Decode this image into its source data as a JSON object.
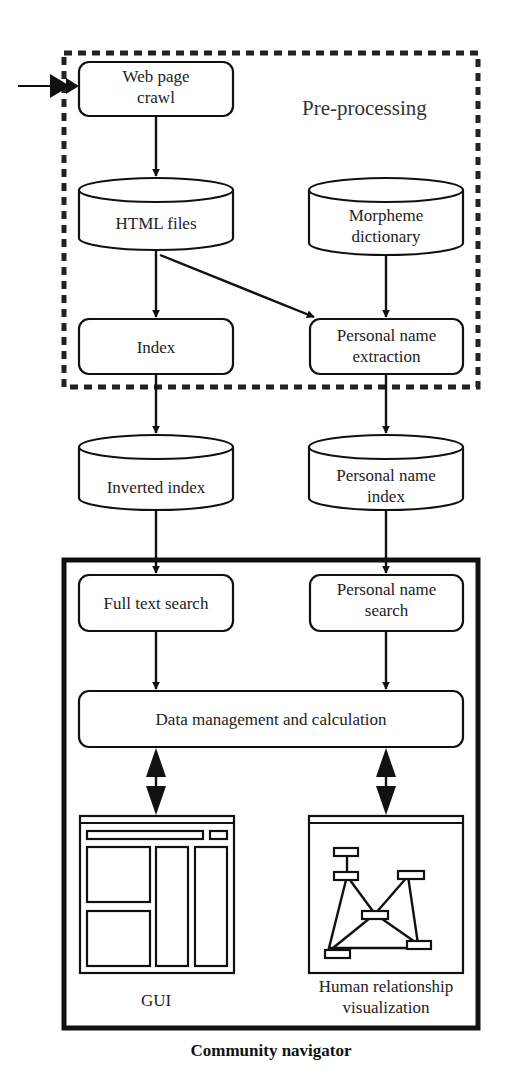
{
  "diagram": {
    "regions": {
      "preprocessing": {
        "title": "Pre-processing",
        "border": "dashed"
      },
      "community_navigator": {
        "title": "Community navigator",
        "border": "solid-thick"
      }
    },
    "nodes": {
      "web_crawl": {
        "line1": "Web page",
        "line2": "crawl",
        "shape": "rounded-rect"
      },
      "html_files": {
        "line1": "HTML files",
        "shape": "cylinder"
      },
      "morpheme_dict": {
        "line1": "Morpheme",
        "line2": "dictionary",
        "shape": "cylinder"
      },
      "index": {
        "line1": "Index",
        "shape": "rounded-rect"
      },
      "name_extraction": {
        "line1": "Personal name",
        "line2": "extraction",
        "shape": "rounded-rect"
      },
      "inverted_index": {
        "line1": "Inverted index",
        "shape": "cylinder"
      },
      "name_index": {
        "line1": "Personal name",
        "line2": "index",
        "shape": "cylinder"
      },
      "full_text_search": {
        "line1": "Full text search",
        "shape": "rounded-rect"
      },
      "name_search": {
        "line1": "Personal name",
        "line2": "search",
        "shape": "rounded-rect"
      },
      "data_mgmt": {
        "line1": "Data management and calculation",
        "shape": "rounded-rect"
      },
      "gui": {
        "line1": "GUI",
        "shape": "window-icon"
      },
      "visualization": {
        "line1": "Human relationship",
        "line2": "visualization",
        "shape": "graph-window-icon"
      }
    },
    "edges": [
      {
        "from": "external",
        "to": "web_crawl",
        "type": "arrow"
      },
      {
        "from": "web_crawl",
        "to": "html_files",
        "type": "arrow"
      },
      {
        "from": "html_files",
        "to": "index",
        "type": "arrow"
      },
      {
        "from": "html_files",
        "to": "name_extraction",
        "type": "arrow"
      },
      {
        "from": "morpheme_dict",
        "to": "name_extraction",
        "type": "arrow"
      },
      {
        "from": "index",
        "to": "inverted_index",
        "type": "arrow"
      },
      {
        "from": "name_extraction",
        "to": "name_index",
        "type": "arrow"
      },
      {
        "from": "inverted_index",
        "to": "full_text_search",
        "type": "arrow"
      },
      {
        "from": "name_index",
        "to": "name_search",
        "type": "arrow"
      },
      {
        "from": "full_text_search",
        "to": "data_mgmt",
        "type": "arrow"
      },
      {
        "from": "name_search",
        "to": "data_mgmt",
        "type": "arrow"
      },
      {
        "from": "data_mgmt",
        "to": "gui",
        "type": "bidirectional"
      },
      {
        "from": "data_mgmt",
        "to": "visualization",
        "type": "bidirectional"
      }
    ],
    "colors": {
      "stroke": "#111111",
      "background": "#ffffff",
      "text": "#222222"
    }
  }
}
